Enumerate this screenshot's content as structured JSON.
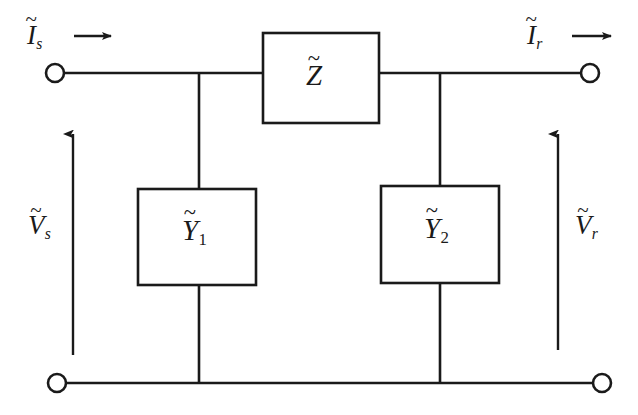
{
  "diagram": {
    "stroke_color": "#1a1a1a",
    "background_color": "#ffffff",
    "labels": {
      "current_sending": {
        "symbol": "I",
        "subscript": "s",
        "accent": "~",
        "arrow": "right-arrow"
      },
      "current_receiving": {
        "symbol": "I",
        "subscript": "r",
        "accent": "~",
        "arrow": "right-arrow"
      },
      "voltage_sending": {
        "symbol": "V",
        "subscript": "s",
        "accent": "~",
        "arrow": "up-arrow"
      },
      "voltage_receiving": {
        "symbol": "V",
        "subscript": "r",
        "accent": "~",
        "arrow": "up-arrow"
      },
      "series_impedance": {
        "symbol": "Z",
        "subscript": "",
        "accent": "~"
      },
      "shunt_admittance_1": {
        "symbol": "Y",
        "subscript": "1",
        "accent": "~"
      },
      "shunt_admittance_2": {
        "symbol": "Y",
        "subscript": "2",
        "accent": "~"
      }
    },
    "components": {
      "series_box": {
        "x": 263,
        "y": 33,
        "width": 116,
        "height": 90
      },
      "shunt_box_1": {
        "x": 138,
        "y": 189,
        "width": 118,
        "height": 96
      },
      "shunt_box_2": {
        "x": 381,
        "y": 186,
        "width": 118,
        "height": 97
      }
    },
    "terminals": [
      {
        "name": "sending-top",
        "cx": 55,
        "cy": 73,
        "r": 9
      },
      {
        "name": "receiving-top",
        "cx": 590,
        "cy": 73,
        "r": 9
      },
      {
        "name": "sending-bottom",
        "cx": 57,
        "cy": 383,
        "r": 9
      },
      {
        "name": "receiving-bottom",
        "cx": 602,
        "cy": 383,
        "r": 9
      }
    ]
  }
}
